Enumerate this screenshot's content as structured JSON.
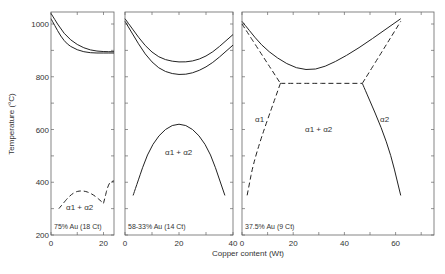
{
  "chart_data": {
    "type": "line",
    "title": "",
    "ylabel": "Temperature (°C)",
    "xlabel": "Copper content (Wt)",
    "ylim": [
      200,
      1050
    ],
    "yticks": [
      "200",
      "400",
      "600",
      "800",
      "1000"
    ],
    "panels": [
      {
        "label": "75% Au (18 Ct)",
        "xlim": [
          0,
          24
        ],
        "xticks": [
          "0",
          "20"
        ],
        "region_labels": [
          "α1 + α2"
        ],
        "series": [
          {
            "name": "liquidus",
            "style": "solid",
            "x": [
              0,
              5,
              10,
              15,
              20,
              24
            ],
            "y": [
              1040,
              960,
              920,
              900,
              895,
              895
            ]
          },
          {
            "name": "solidus",
            "style": "solid",
            "x": [
              0,
              5,
              10,
              15,
              20,
              24
            ],
            "y": [
              1020,
              930,
              900,
              890,
              890,
              890
            ]
          },
          {
            "name": "miscibility gap",
            "style": "dashed",
            "x": [
              3,
              8,
              12,
              16,
              20
            ],
            "y": [
              300,
              360,
              370,
              355,
              320
            ]
          },
          {
            "name": "ordering",
            "style": "dashed",
            "x": [
              20,
              22,
              24
            ],
            "y": [
              320,
              400,
              405
            ]
          }
        ]
      },
      {
        "label": "58-33% Au (14 Ct)",
        "xlim": [
          0,
          40
        ],
        "xticks": [
          "0",
          "20",
          "40"
        ],
        "region_labels": [
          "α1 + α2"
        ],
        "series": [
          {
            "name": "liquidus",
            "style": "solid",
            "x": [
              0,
              10,
              20,
              30,
              40
            ],
            "y": [
              1020,
              880,
              850,
              870,
              960
            ]
          },
          {
            "name": "solidus",
            "style": "solid",
            "x": [
              0,
              10,
              20,
              30,
              40
            ],
            "y": [
              1010,
              840,
              800,
              830,
              920
            ]
          },
          {
            "name": "miscibility gap",
            "style": "solid",
            "x": [
              3,
              10,
              20,
              30,
              37
            ],
            "y": [
              350,
              560,
              640,
              560,
              350
            ]
          }
        ]
      },
      {
        "label": "37.5% Au (9 Ct)",
        "xlim": [
          0,
          75
        ],
        "xticks": [
          "0",
          "20",
          "40",
          "60"
        ],
        "region_labels": [
          "α1",
          "α1 + α2",
          "α2"
        ],
        "series": [
          {
            "name": "liquidus",
            "style": "solid",
            "x": [
              0,
              10,
              25,
              40,
              62
            ],
            "y": [
              1010,
              890,
              810,
              870,
              1020
            ]
          },
          {
            "name": "solidus",
            "style": "dashed",
            "x": [
              0,
              8,
              15
            ],
            "y": [
              1000,
              880,
              775
            ]
          },
          {
            "name": "eutectic",
            "style": "dashed",
            "x": [
              15,
              47
            ],
            "y": [
              775,
              775
            ]
          },
          {
            "name": "alpha2 solidus",
            "style": "dashed",
            "x": [
              47,
              55,
              62
            ],
            "y": [
              775,
              900,
              1010
            ]
          },
          {
            "name": "alpha1 solvus",
            "style": "dashed",
            "x": [
              15,
              5,
              2
            ],
            "y": [
              775,
              500,
              350
            ]
          },
          {
            "name": "alpha2 solvus",
            "style": "solid",
            "x": [
              47,
              57,
              62
            ],
            "y": [
              775,
              550,
              350
            ]
          }
        ]
      }
    ]
  }
}
